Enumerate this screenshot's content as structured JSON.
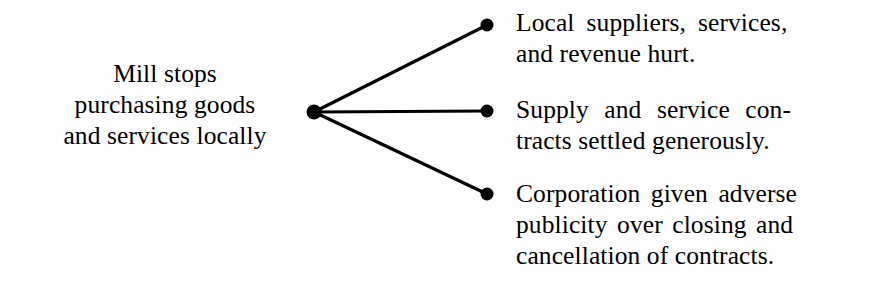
{
  "diagram": {
    "type": "consequence-fan",
    "background_color": "#fdfdfd",
    "stroke_color": "#000000",
    "node_color": "#000000",
    "cause": {
      "id": "cause-node",
      "lines": [
        "Mill stops",
        "purchasing goods",
        "and services locally"
      ],
      "node": {
        "cx": 314,
        "cy": 112,
        "r": 7.5
      }
    },
    "effects": [
      {
        "id": "effect-0",
        "lines": [
          "Local suppliers, services,",
          "and revenue hurt."
        ],
        "node": {
          "cx": 487,
          "cy": 25,
          "r": 6.5
        }
      },
      {
        "id": "effect-1",
        "lines": [
          "Supply and service con-",
          "tracts settled generously."
        ],
        "node": {
          "cx": 487,
          "cy": 111,
          "r": 6.5
        }
      },
      {
        "id": "effect-2",
        "lines": [
          "Corporation given adverse",
          "publicity over closing and",
          "cancellation of contracts."
        ],
        "node": {
          "cx": 487,
          "cy": 194,
          "r": 6.5
        }
      }
    ],
    "edges": [
      {
        "id": "edge-0",
        "from": "cause-node",
        "to": "effect-0",
        "x1": 314,
        "y1": 112,
        "x2": 487,
        "y2": 25,
        "width": 3.2
      },
      {
        "id": "edge-1",
        "from": "cause-node",
        "to": "effect-1",
        "x1": 314,
        "y1": 112,
        "x2": 487,
        "y2": 111,
        "width": 3.2
      },
      {
        "id": "edge-2",
        "from": "cause-node",
        "to": "effect-2",
        "x1": 314,
        "y1": 112,
        "x2": 487,
        "y2": 194,
        "width": 3.2
      }
    ]
  }
}
